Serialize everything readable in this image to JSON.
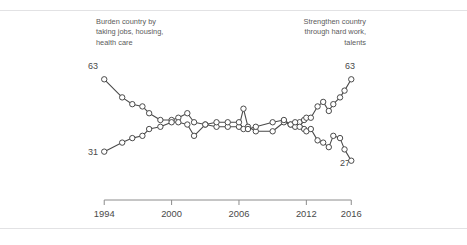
{
  "figure": {
    "clipped_title_text": "",
    "annotation_left": "Burden country by\ntaking jobs, housing,\nhealth care",
    "annotation_right": "Strengthen country\nthrough hard work,\ntalents",
    "end_label_left_top": "63",
    "end_label_left_bottom": "31",
    "end_label_right_top": "63",
    "end_label_right_bottom": "27",
    "colors": {
      "line": "#4a4a4a",
      "marker_fill": "#ffffff",
      "marker_stroke": "#4a4a4a",
      "axis": "#8c8c8c",
      "rule": "#e2e2e4",
      "text": "#4a4a4a"
    }
  },
  "chart_data": {
    "type": "line",
    "title": "",
    "subtitle": "",
    "xlabel": "",
    "ylabel": "",
    "xlim": [
      1993,
      2016.6
    ],
    "ylim": [
      22,
      68
    ],
    "grid": false,
    "legend_position": "inline-annotations",
    "tick_labels": [
      "1994",
      "2000",
      "2006",
      "2012",
      "2016"
    ],
    "tick_values": [
      1994,
      2000,
      2006,
      2012,
      2016
    ],
    "axis_line_range": [
      1994,
      2016
    ],
    "marker": "open-circle",
    "annotations": [
      {
        "text": "Burden country by taking jobs, housing, health care",
        "series": "burden",
        "align": "left"
      },
      {
        "text": "Strengthen country through hard work, talents",
        "series": "strengthen",
        "align": "right"
      }
    ],
    "point_labels": [
      {
        "text": "63",
        "series": "burden",
        "x": 1994,
        "y": 63
      },
      {
        "text": "31",
        "series": "strengthen",
        "x": 1994,
        "y": 31
      },
      {
        "text": "63",
        "series": "strengthen",
        "x": 2016,
        "y": 63
      },
      {
        "text": "27",
        "series": "burden",
        "x": 2016,
        "y": 27
      }
    ],
    "series": [
      {
        "name": "Burden country by taking jobs, housing, health care",
        "x": [
          1994,
          1995.6,
          1996.5,
          1997.4,
          1998,
          1999,
          2000,
          2000.6,
          2001.4,
          2002,
          2003,
          2004,
          2005,
          2006,
          2006.4,
          2006.8,
          2007.5,
          2009,
          2010,
          2010.6,
          2011,
          2011.4,
          2011.8,
          2012,
          2012.4,
          2013,
          2013.5,
          2014,
          2014.4,
          2015,
          2015.4,
          2016
        ],
        "y": [
          63,
          55,
          52,
          51,
          48,
          45,
          45,
          46,
          48,
          44,
          43,
          42,
          42,
          42,
          50,
          42,
          40,
          40,
          44,
          43,
          42,
          44,
          41,
          40,
          41,
          36,
          35,
          33,
          38,
          37,
          32,
          27
        ]
      },
      {
        "name": "Strengthen country through hard work, talents",
        "x": [
          1994,
          1995.6,
          1996.5,
          1997.4,
          1998,
          1999,
          2000,
          2000.6,
          2001.4,
          2002,
          2003,
          2004,
          2005,
          2006,
          2006.4,
          2006.8,
          2007.5,
          2009,
          2010,
          2010.6,
          2011,
          2011.4,
          2011.8,
          2012,
          2012.4,
          2013,
          2013.5,
          2014,
          2014.4,
          2015,
          2015.4,
          2016
        ],
        "y": [
          31,
          35,
          37,
          38,
          41,
          42,
          44,
          44,
          43,
          38,
          43,
          44,
          44,
          44,
          41,
          41,
          42,
          44,
          45,
          43,
          44,
          42,
          45,
          46,
          46,
          51,
          53,
          49,
          52,
          55,
          58,
          63
        ]
      }
    ]
  }
}
